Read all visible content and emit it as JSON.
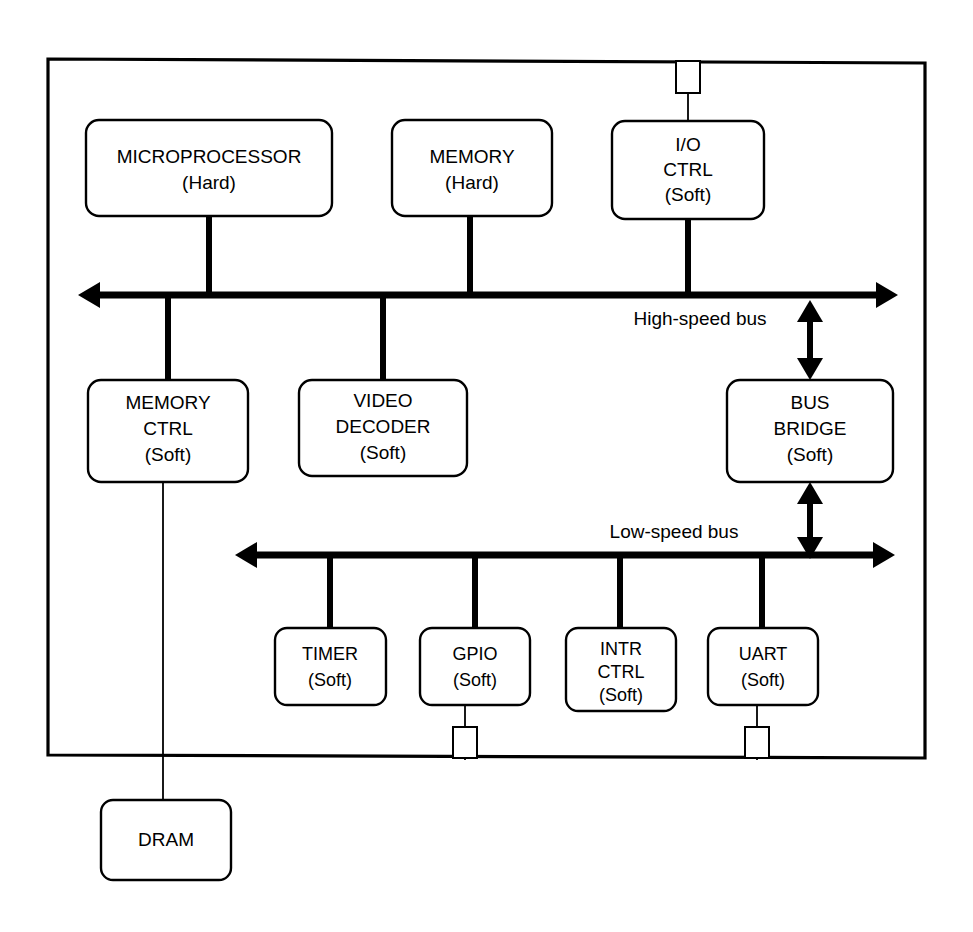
{
  "diagram": {
    "chip_boundary_label": "",
    "colors": {
      "line": "#000000",
      "background": "#ffffff",
      "block_fill": "#ffffff"
    },
    "buses": [
      {
        "id": "high-speed-bus",
        "label": "High-speed bus",
        "arrow_style": "double-ended"
      },
      {
        "id": "low-speed-bus",
        "label": "Low-speed bus",
        "arrow_style": "double-ended"
      }
    ],
    "blocks": [
      {
        "id": "microprocessor",
        "line1": "MICROPROCESSOR",
        "line2": "(Hard)",
        "line3": "",
        "kind": "Hard",
        "bus": "high-speed-bus"
      },
      {
        "id": "memory",
        "line1": "MEMORY",
        "line2": "(Hard)",
        "line3": "",
        "kind": "Hard",
        "bus": "high-speed-bus"
      },
      {
        "id": "io-ctrl",
        "line1": "I/O",
        "line2": "CTRL",
        "line3": "(Soft)",
        "kind": "Soft",
        "bus": "high-speed-bus"
      },
      {
        "id": "memory-ctrl",
        "line1": "MEMORY",
        "line2": "CTRL",
        "line3": "(Soft)",
        "kind": "Soft",
        "bus": "high-speed-bus"
      },
      {
        "id": "video-decoder",
        "line1": "VIDEO",
        "line2": "DECODER",
        "line3": "(Soft)",
        "kind": "Soft",
        "bus": "high-speed-bus"
      },
      {
        "id": "bus-bridge",
        "line1": "BUS",
        "line2": "BRIDGE",
        "line3": "(Soft)",
        "kind": "Soft",
        "bus": "both"
      },
      {
        "id": "timer",
        "line1": "TIMER",
        "line2": "(Soft)",
        "line3": "",
        "kind": "Soft",
        "bus": "low-speed-bus"
      },
      {
        "id": "gpio",
        "line1": "GPIO",
        "line2": "(Soft)",
        "line3": "",
        "kind": "Soft",
        "bus": "low-speed-bus"
      },
      {
        "id": "intr-ctrl",
        "line1": "INTR",
        "line2": "CTRL",
        "line3": "(Soft)",
        "kind": "Soft",
        "bus": "low-speed-bus"
      },
      {
        "id": "uart",
        "line1": "UART",
        "line2": "(Soft)",
        "line3": "",
        "kind": "Soft",
        "bus": "low-speed-bus"
      },
      {
        "id": "dram",
        "line1": "DRAM",
        "line2": "",
        "line3": "",
        "kind": "External",
        "bus": "none"
      }
    ],
    "pins": [
      {
        "id": "pin-io-ctrl",
        "edge": "top",
        "connects": "io-ctrl"
      },
      {
        "id": "pin-gpio",
        "edge": "bottom",
        "connects": "gpio"
      },
      {
        "id": "pin-uart",
        "edge": "bottom",
        "connects": "uart"
      }
    ]
  }
}
